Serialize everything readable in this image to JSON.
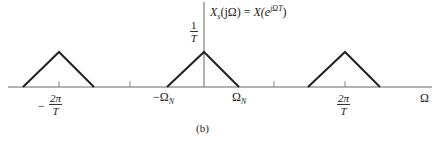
{
  "figure": {
    "caption": "(b)",
    "function_label": "X_s(jΩ) = X(e^{jΩT})",
    "function_label_parts": {
      "lhs": "X",
      "lhs_sub": "s",
      "lhs_arg": "(jΩ) = ",
      "rhs": "X(e",
      "rhs_sup": "jΩT",
      "rhs_close": ")"
    },
    "peak_label": {
      "num": "1",
      "den": "T"
    },
    "axis_label": "Ω",
    "ticks": [
      {
        "id": "neg-2pi-over-T",
        "sign": "−",
        "num": "2π",
        "den": "T"
      },
      {
        "id": "neg-omega-n",
        "text": "−Ω",
        "sub": "N"
      },
      {
        "id": "omega-n",
        "text": "Ω",
        "sub": "N"
      },
      {
        "id": "pos-2pi-over-T",
        "num": "2π",
        "den": "T"
      }
    ],
    "colors": {
      "axis": "#555555",
      "triangle": "#222222",
      "text": "#222222"
    }
  }
}
